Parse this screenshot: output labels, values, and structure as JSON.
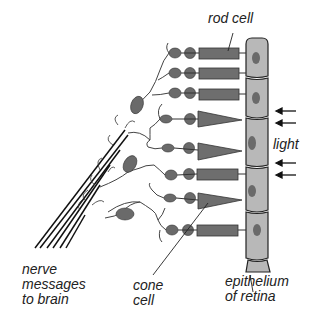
{
  "diagram": {
    "labels": {
      "rod_cell": "rod cell",
      "light": "light",
      "nerve_line1": "nerve",
      "nerve_line2": "messages",
      "nerve_line3": "to brain",
      "cone_line1": "cone",
      "cone_line2": "cell",
      "epi_line1": "epithelium",
      "epi_line2": "of retina"
    },
    "colors": {
      "cell_fill": "#6e6e6e",
      "nucleus": "#5a5a5a",
      "epithelium_fill": "#b8b8b8",
      "line": "#222222"
    },
    "photoreceptors": [
      {
        "type": "rod",
        "y": 53
      },
      {
        "type": "rod",
        "y": 73
      },
      {
        "type": "rod",
        "y": 93
      },
      {
        "type": "cone",
        "y": 119
      },
      {
        "type": "cone",
        "y": 152
      },
      {
        "type": "rod",
        "y": 174
      },
      {
        "type": "cone",
        "y": 200
      },
      {
        "type": "rod",
        "y": 230
      }
    ]
  }
}
